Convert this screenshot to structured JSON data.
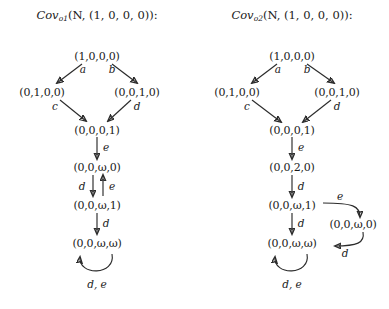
{
  "canvas": {
    "width": 389,
    "height": 309,
    "background": "#ffffff",
    "ink": "#2b2b2b"
  },
  "diagrams": [
    {
      "id": "cov-o1",
      "title": {
        "fn": "Cov",
        "sub": "o",
        "sub_index": "1",
        "args": "(N, (1, 0, 0, 0)):",
        "full": "Cov_{o1}(N, (1,0,0,0)):"
      },
      "nodes": [
        {
          "id": "n0",
          "label": "(1,0,0,0)",
          "x": 97,
          "y": 57
        },
        {
          "id": "n1",
          "label": "(0,1,0,0)",
          "x": 42,
          "y": 93
        },
        {
          "id": "n2",
          "label": "(0,0,1,0)",
          "x": 137,
          "y": 93
        },
        {
          "id": "n3",
          "label": "(0,0,0,1)",
          "x": 97,
          "y": 131
        },
        {
          "id": "n4",
          "label": "(0,0,ω,0)",
          "x": 97,
          "y": 168
        },
        {
          "id": "n5",
          "label": "(0,0,ω,1)",
          "x": 97,
          "y": 206
        },
        {
          "id": "n6",
          "label": "(0,0,ω,ω)",
          "x": 97,
          "y": 244
        }
      ],
      "edge_labels": [
        {
          "id": "e-a",
          "text": "a",
          "x": 83,
          "y": 70
        },
        {
          "id": "e-b",
          "text": "b",
          "x": 112,
          "y": 70
        },
        {
          "id": "e-c",
          "text": "c",
          "x": 60,
          "y": 107
        },
        {
          "id": "e-d1",
          "text": "d",
          "x": 133,
          "y": 107
        },
        {
          "id": "e-e1",
          "text": "e",
          "x": 107,
          "y": 148
        },
        {
          "id": "e-d2",
          "text": "d",
          "x": 83,
          "y": 187
        },
        {
          "id": "e-e2",
          "text": "e",
          "x": 110,
          "y": 187
        },
        {
          "id": "e-d3",
          "text": "d",
          "x": 107,
          "y": 224
        },
        {
          "id": "e-de",
          "text": "d, e",
          "x": 97,
          "y": 286
        }
      ]
    },
    {
      "id": "cov-o2",
      "title": {
        "fn": "Cov",
        "sub": "o",
        "sub_index": "2",
        "args": "(N, (1, 0, 0, 0)):",
        "full": "Cov_{o2}(N, (1,0,0,0)):"
      },
      "nodes": [
        {
          "id": "m0",
          "label": "(1,0,0,0)",
          "x": 97,
          "y": 57
        },
        {
          "id": "m1",
          "label": "(0,1,0,0)",
          "x": 42,
          "y": 93
        },
        {
          "id": "m2",
          "label": "(0,0,1,0)",
          "x": 142,
          "y": 93
        },
        {
          "id": "m3",
          "label": "(0,0,0,1)",
          "x": 97,
          "y": 131
        },
        {
          "id": "m4",
          "label": "(0,0,2,0)",
          "x": 97,
          "y": 168
        },
        {
          "id": "m5",
          "label": "(0,0,ω,1)",
          "x": 97,
          "y": 206
        },
        {
          "id": "m6",
          "label": "(0,0,ω,0)",
          "x": 160,
          "y": 225
        },
        {
          "id": "m7",
          "label": "(0,0,ω,ω)",
          "x": 97,
          "y": 244
        }
      ],
      "edge_labels": [
        {
          "id": "f-a",
          "text": "a",
          "x": 83,
          "y": 70
        },
        {
          "id": "f-b",
          "text": "b",
          "x": 112,
          "y": 70
        },
        {
          "id": "f-c",
          "text": "c",
          "x": 57,
          "y": 107
        },
        {
          "id": "f-d1",
          "text": "d",
          "x": 138,
          "y": 107
        },
        {
          "id": "f-e1",
          "text": "e",
          "x": 107,
          "y": 148
        },
        {
          "id": "f-d2",
          "text": "d",
          "x": 107,
          "y": 187
        },
        {
          "id": "f-e2",
          "text": "e",
          "x": 143,
          "y": 196
        },
        {
          "id": "f-d3",
          "text": "d",
          "x": 107,
          "y": 224
        },
        {
          "id": "f-d4",
          "text": "d",
          "x": 147,
          "y": 254
        },
        {
          "id": "f-de",
          "text": "d, e",
          "x": 97,
          "y": 286
        }
      ]
    }
  ]
}
